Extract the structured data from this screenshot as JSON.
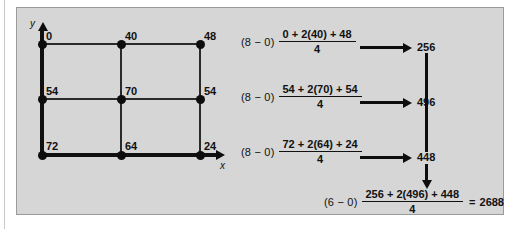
{
  "figure": {
    "axes": {
      "x_label": "x",
      "y_label": "y"
    },
    "grid": {
      "rows": 3,
      "cols": 3,
      "node_values": [
        [
          "0",
          "40",
          "48"
        ],
        [
          "54",
          "70",
          "54"
        ],
        [
          "72",
          "64",
          "24"
        ]
      ]
    }
  },
  "equations": {
    "row1": {
      "prefix": "(8 − 0)",
      "numerator": "0 + 2(40) + 48",
      "denominator": "4",
      "result": "256"
    },
    "row2": {
      "prefix": "(8 − 0)",
      "numerator": "54 + 2(70) + 54",
      "denominator": "4",
      "result": "496"
    },
    "row3": {
      "prefix": "(8 − 0)",
      "numerator": "72 + 2(64) + 24",
      "denominator": "4",
      "result": "448"
    },
    "final": {
      "prefix": "(6 − 0)",
      "numerator": "256 + 2(496) + 448",
      "denominator": "4",
      "equals": "=",
      "result": "2688"
    }
  },
  "colors": {
    "panel_background": "#d6d6d6",
    "panel_border": "#9b9b9b",
    "ink": "#111111",
    "page_background": "#ffffff"
  }
}
